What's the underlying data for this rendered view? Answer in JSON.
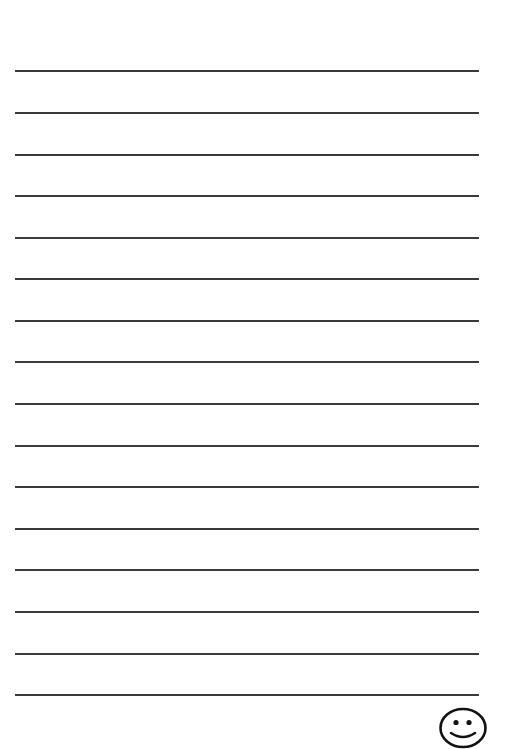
{
  "sheet": {
    "type": "lined-writing-paper",
    "line_count": 16,
    "line_positions_y": [
      71,
      113,
      155,
      196,
      238,
      279,
      321,
      362,
      404,
      446,
      487,
      529,
      570,
      612,
      654,
      695
    ],
    "line_color": "#3a3a3a",
    "background_color": "#ffffff"
  },
  "decoration": {
    "icon": "smiley-face-icon",
    "stroke_color": "#111111"
  }
}
